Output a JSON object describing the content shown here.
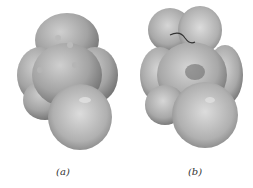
{
  "figure": {
    "panels": [
      {
        "label": "(a)",
        "description": "molecular surface model, view a"
      },
      {
        "label": "(b)",
        "description": "molecular surface model, view b"
      }
    ],
    "colors": {
      "surface_light": "#c8c8c8",
      "surface_mid": "#9a9a9a",
      "surface_dark": "#6a6a6a",
      "background": "#ffffff"
    }
  }
}
